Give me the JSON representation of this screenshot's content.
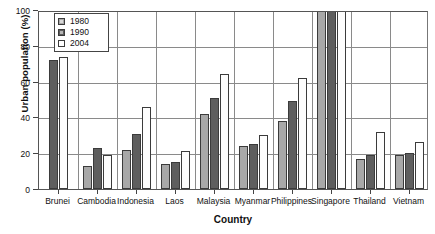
{
  "chart_data": {
    "type": "bar",
    "title": "",
    "xlabel": "Country",
    "ylabel": "Urban population (%)",
    "ylim": [
      0,
      100
    ],
    "yticks": [
      0,
      20,
      40,
      60,
      80,
      100
    ],
    "grid": true,
    "legend_position": "upper-left",
    "categories": [
      "Brunei",
      "Cambodia",
      "Indonesia",
      "Laos",
      "Malaysia",
      "Myanmar",
      "Philippines",
      "Singapore",
      "Thailand",
      "Vietnam"
    ],
    "series": [
      {
        "name": "1980",
        "color": "#a8a8a8",
        "values": [
          null,
          13,
          22,
          14,
          42,
          24,
          38,
          100,
          17,
          19
        ]
      },
      {
        "name": "1990",
        "color": "#5e5e5e",
        "values": [
          72,
          23,
          31,
          15,
          51,
          25,
          49,
          100,
          19,
          20
        ]
      },
      {
        "name": "2004",
        "color": "#ffffff",
        "values": [
          74,
          19,
          46,
          21,
          64,
          30,
          62,
          100,
          32,
          26
        ]
      }
    ]
  },
  "legend": {
    "entries": [
      {
        "label": "1980"
      },
      {
        "label": "1990"
      },
      {
        "label": "2004"
      }
    ]
  },
  "axes": {
    "y_title": "Urban population (%)",
    "x_title": "Country",
    "y_tick_labels": [
      "0",
      "20",
      "40",
      "60",
      "80",
      "100"
    ]
  }
}
